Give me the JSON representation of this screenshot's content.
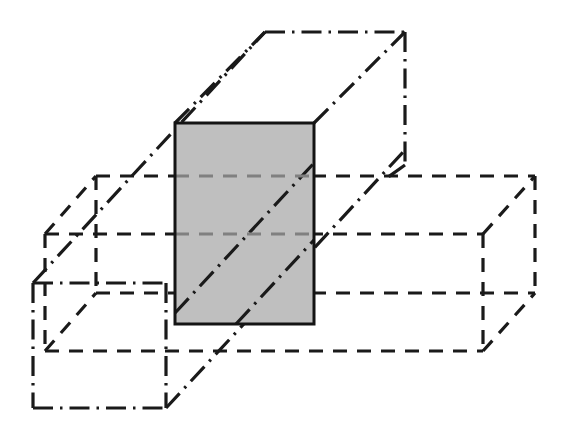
{
  "figure": {
    "title": "Intersection of two rectangular prisms",
    "background_color": "#ffffff",
    "width": 562,
    "height": 438
  },
  "styles": {
    "dashed_line": {
      "name": "dashed",
      "color": "#1a1a1a",
      "stroke_width": 3.2,
      "dash_pattern": "14 10"
    },
    "dashdot_line": {
      "name": "dash-dot",
      "color": "#1a1a1a",
      "stroke_width": 3.2,
      "dash_pattern": "20 7 2.5 7"
    },
    "solid_line": {
      "name": "solid",
      "color": "#141414",
      "stroke_width": 3.0,
      "dash_pattern": "none"
    },
    "shaded_face": {
      "name": "grey-fill",
      "fill_color": "#bfbfbf",
      "stroke_color": "#141414"
    }
  },
  "shapes": {
    "horizontal_box": {
      "label": "horizontal-box",
      "line_style": "dashed",
      "vertices": {
        "front_top_left": [
          45,
          234
        ],
        "front_top_right": [
          483,
          234
        ],
        "front_bottom_left": [
          45,
          351
        ],
        "front_bottom_right": [
          483,
          351
        ],
        "back_top_left": [
          96,
          176
        ],
        "back_top_right": [
          535,
          176
        ],
        "back_bottom_left": [
          96,
          293
        ],
        "back_bottom_right": [
          535,
          293
        ]
      }
    },
    "vertical_box": {
      "label": "vertical-box",
      "line_style": "dash-dot",
      "vertices": {
        "top_front_left": [
          175,
          123
        ],
        "top_front_right": [
          314,
          123
        ],
        "top_back_left": [
          265,
          32
        ],
        "top_back_right": [
          405,
          32
        ],
        "bottom_front_left": [
          33,
          283
        ],
        "bottom_front_right": [
          166,
          283
        ],
        "bottom_back_left": [
          33,
          408
        ],
        "bottom_back_right": [
          166,
          408
        ]
      }
    },
    "intersection_face": {
      "label": "intersection-shaded-rectangle",
      "line_style": "solid",
      "fill": "#bfbfbf",
      "rect": {
        "x": 175,
        "y": 123,
        "width": 139,
        "height": 201
      }
    }
  },
  "chart_data": {
    "type": "diagram",
    "title": "Intersection of two rectangular prisms",
    "elements": [
      {
        "name": "horizontal-box",
        "style": "dashed",
        "role": "hidden-outline-solid"
      },
      {
        "name": "vertical-box",
        "style": "dash-dot",
        "role": "centre-line-solid"
      },
      {
        "name": "intersection-face",
        "style": "solid",
        "role": "shaded-common-region"
      }
    ]
  }
}
